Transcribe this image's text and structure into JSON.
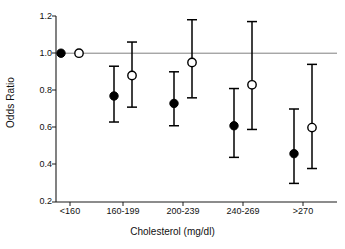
{
  "chart_data": {
    "type": "scatter",
    "title": "",
    "xlabel": "Cholesterol (mg/dl)",
    "ylabel": "Odds Ratio",
    "categories": [
      "<160",
      "160-199",
      "200-239",
      "240-269",
      ">270"
    ],
    "ylim": [
      0.2,
      1.2
    ],
    "yticks": [
      0.2,
      0.4,
      0.6,
      0.8,
      1.0,
      1.2
    ],
    "ytick_labels": [
      "0.2",
      "0.4",
      "0.6",
      "0.8",
      "1.0",
      "1.2"
    ],
    "grid": false,
    "legend": "none",
    "reference_line": {
      "y": 1.0,
      "color": "#808080"
    },
    "series": [
      {
        "name": "filled",
        "marker": "filled-circle",
        "color": "#000000",
        "values": [
          1.0,
          0.77,
          0.73,
          0.61,
          0.46
        ],
        "ci_low": [
          null,
          0.63,
          0.61,
          0.44,
          0.3
        ],
        "ci_high": [
          null,
          0.93,
          0.9,
          0.81,
          0.7
        ]
      },
      {
        "name": "open",
        "marker": "open-circle",
        "color": "#000000",
        "values": [
          1.0,
          0.88,
          0.95,
          0.83,
          0.6
        ],
        "ci_low": [
          null,
          0.71,
          0.76,
          0.59,
          0.38
        ],
        "ci_high": [
          null,
          1.06,
          1.18,
          1.17,
          0.94
        ]
      }
    ]
  },
  "axes": {
    "y_axis_title": "Odds Ratio",
    "x_axis_title": "Cholesterol (mg/dl)"
  }
}
